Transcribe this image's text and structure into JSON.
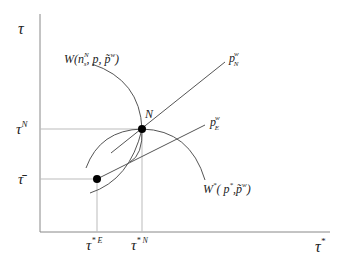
{
  "diagram": {
    "axes": {
      "y_label": "τ",
      "x_label": "τ",
      "x_label_sup": "*"
    },
    "y_ticks": [
      {
        "label": "τ",
        "sup": "N",
        "y": 129
      },
      {
        "label": "τ̄",
        "sup": "",
        "y": 179
      }
    ],
    "x_ticks": [
      {
        "label": "τ",
        "sup": "* E",
        "x": 97
      },
      {
        "label": "τ",
        "sup": "* N",
        "x": 142
      }
    ],
    "points": [
      {
        "name": "N",
        "label": "N",
        "x": 142,
        "y": 129
      },
      {
        "name": "E",
        "label": "",
        "x": 97,
        "y": 179
      }
    ],
    "lines": {
      "p_N": {
        "base": "p",
        "sup": "w",
        "sub": "N"
      },
      "p_E": {
        "base": "p",
        "sup": "w",
        "sub": "E"
      }
    },
    "curves": {
      "W": {
        "label": "W(n",
        "sup": "N",
        "sub": "s",
        "rest": ", p, p̃",
        "rest_sup": "w",
        "close": ")"
      },
      "W_star": {
        "label": "W",
        "sup": "*",
        "mid": "( p",
        "mid_sup": "*",
        "rest": ",p̃",
        "rest_sup": "w",
        "close": ")"
      }
    },
    "colors": {
      "line": "#555555",
      "axis": "#888888",
      "guide": "#bbbbbb",
      "point": "#000000"
    }
  }
}
